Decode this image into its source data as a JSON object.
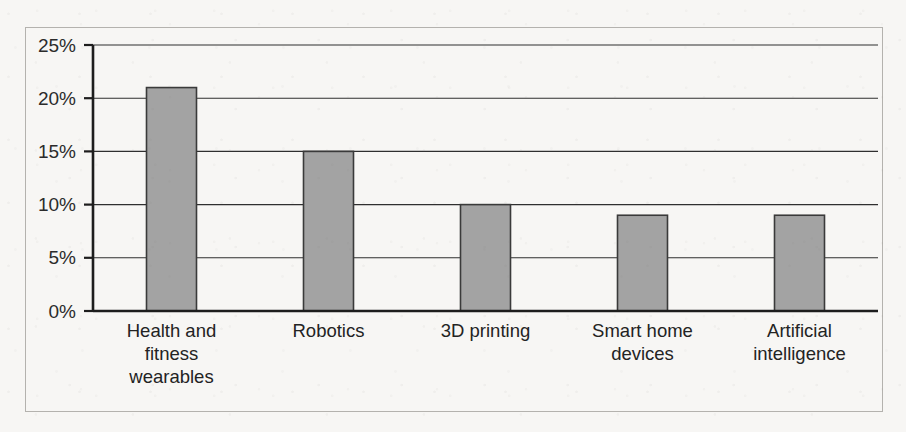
{
  "chart_data": {
    "type": "bar",
    "title": "",
    "subtitle": "",
    "xlabel": "",
    "ylabel": "",
    "categories": [
      "Health and fitness wearables",
      "Robotics",
      "3D printing",
      "Smart home devices",
      "Artificial intelligence"
    ],
    "category_lines": [
      [
        "Health and",
        "fitness",
        "wearables"
      ],
      [
        "Robotics"
      ],
      [
        "3D printing"
      ],
      [
        "Smart home",
        "devices"
      ],
      [
        "Artificial",
        "intelligence"
      ]
    ],
    "values": [
      21,
      15,
      10,
      9,
      9
    ],
    "value_labels": [
      "21%",
      "15%",
      "10%",
      "9%",
      "9%"
    ],
    "ylim": [
      0,
      25
    ],
    "ytick_values": [
      0,
      5,
      10,
      15,
      20,
      25
    ],
    "ytick_labels": [
      "0%",
      "5%",
      "10%",
      "15%",
      "20%",
      "25%"
    ],
    "grid": true,
    "legend": false,
    "legend_position": "none",
    "units": "percent"
  },
  "style": {
    "bar_fill": "#a3a3a3",
    "bar_stroke": "#3a3a3a",
    "gridline_color": "#2f2f2f",
    "axis_color": "#1d1d1d",
    "frame_color": "#b4b2ae",
    "background": "#f7f6f4",
    "text_color": "#232323"
  }
}
